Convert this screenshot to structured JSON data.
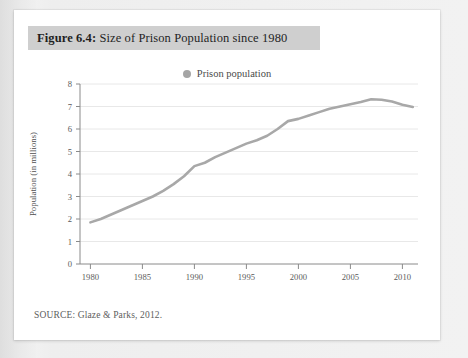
{
  "figure": {
    "label": "Figure 6.4:",
    "title": " Size of Prison Population since 1980",
    "full_title": "Figure 6.4: Size of Prison Population since 1980",
    "source_note": "SOURCE: Glaze & Parks, 2012.",
    "band_color": "#cfcfcf",
    "card_color": "#ffffff"
  },
  "chart_data": {
    "type": "line",
    "title": "Size of Prison Population since 1980",
    "xlabel": "",
    "ylabel": "Population (in millions)",
    "xlim": [
      1979,
      2011.5
    ],
    "ylim": [
      0,
      8
    ],
    "xticks": [
      1980,
      1985,
      1990,
      1995,
      2000,
      2005,
      2010
    ],
    "yticks": [
      0,
      1,
      2,
      3,
      4,
      5,
      6,
      7,
      8
    ],
    "grid": true,
    "legend_position": "top-center",
    "series": [
      {
        "name": "Prison population",
        "color": "#a8a8a8",
        "x": [
          1980,
          1981,
          1982,
          1983,
          1984,
          1985,
          1986,
          1987,
          1988,
          1989,
          1990,
          1991,
          1992,
          1993,
          1994,
          1995,
          1996,
          1997,
          1998,
          1999,
          2000,
          2001,
          2002,
          2003,
          2004,
          2005,
          2006,
          2007,
          2008,
          2009,
          2010,
          2011
        ],
        "values": [
          1.85,
          2.0,
          2.2,
          2.4,
          2.6,
          2.8,
          3.0,
          3.25,
          3.55,
          3.9,
          4.35,
          4.5,
          4.75,
          4.95,
          5.15,
          5.35,
          5.5,
          5.7,
          6.0,
          6.35,
          6.45,
          6.6,
          6.75,
          6.9,
          7.0,
          7.1,
          7.2,
          7.32,
          7.3,
          7.22,
          7.08,
          6.98
        ]
      }
    ]
  },
  "legend": {
    "entries": [
      {
        "label": "Prison population",
        "marker": "dot",
        "color": "#a5a5a5"
      }
    ]
  }
}
